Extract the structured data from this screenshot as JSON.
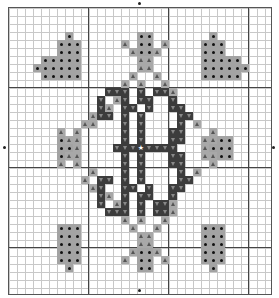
{
  "chart": {
    "cols": 33,
    "rows": 36,
    "cell_size": 8,
    "major_every": 10,
    "colors": {
      "dot": "#a3a3a3",
      "tri": "#a8a8a8",
      "dark": "#3c3c3c",
      "grid": "#c8c8c8",
      "major": "#444444"
    },
    "center_markers": [
      {
        "side": "top",
        "col": 16
      },
      {
        "side": "bottom",
        "col": 16
      },
      {
        "side": "left",
        "row": 17
      },
      {
        "side": "right",
        "row": 17
      }
    ],
    "motifs": [
      {
        "name": "heart-top-left",
        "symbol": "dot",
        "cells": [
          [
            3,
            7
          ],
          [
            4,
            6
          ],
          [
            4,
            7
          ],
          [
            4,
            8
          ],
          [
            5,
            6
          ],
          [
            5,
            7
          ],
          [
            5,
            8
          ],
          [
            6,
            4
          ],
          [
            6,
            5
          ],
          [
            6,
            6
          ],
          [
            6,
            7
          ],
          [
            6,
            8
          ],
          [
            7,
            3
          ],
          [
            7,
            4
          ],
          [
            7,
            5
          ],
          [
            7,
            6
          ],
          [
            7,
            7
          ],
          [
            7,
            8
          ],
          [
            8,
            4
          ],
          [
            8,
            5
          ],
          [
            8,
            6
          ],
          [
            8,
            7
          ],
          [
            8,
            8
          ]
        ]
      },
      {
        "name": "heart-top-right",
        "symbol": "dot",
        "cells": [
          [
            3,
            25
          ],
          [
            4,
            24
          ],
          [
            4,
            25
          ],
          [
            4,
            26
          ],
          [
            5,
            24
          ],
          [
            5,
            25
          ],
          [
            5,
            26
          ],
          [
            6,
            24
          ],
          [
            6,
            25
          ],
          [
            6,
            26
          ],
          [
            6,
            27
          ],
          [
            6,
            28
          ],
          [
            7,
            24
          ],
          [
            7,
            25
          ],
          [
            7,
            26
          ],
          [
            7,
            27
          ],
          [
            7,
            28
          ],
          [
            7,
            29
          ],
          [
            8,
            24
          ],
          [
            8,
            25
          ],
          [
            8,
            26
          ],
          [
            8,
            27
          ],
          [
            8,
            28
          ]
        ]
      },
      {
        "name": "heart-bottom-left",
        "symbol": "dot",
        "cells": [
          [
            27,
            6
          ],
          [
            27,
            7
          ],
          [
            27,
            8
          ],
          [
            28,
            6
          ],
          [
            28,
            7
          ],
          [
            28,
            8
          ],
          [
            29,
            6
          ],
          [
            29,
            7
          ],
          [
            29,
            8
          ],
          [
            30,
            6
          ],
          [
            30,
            7
          ],
          [
            30,
            8
          ],
          [
            31,
            6
          ],
          [
            31,
            7
          ],
          [
            31,
            8
          ],
          [
            32,
            7
          ]
        ]
      },
      {
        "name": "heart-bottom-right",
        "symbol": "dot",
        "cells": [
          [
            27,
            24
          ],
          [
            27,
            25
          ],
          [
            27,
            26
          ],
          [
            28,
            24
          ],
          [
            28,
            25
          ],
          [
            28,
            26
          ],
          [
            29,
            24
          ],
          [
            29,
            25
          ],
          [
            29,
            26
          ],
          [
            30,
            24
          ],
          [
            30,
            25
          ],
          [
            30,
            26
          ],
          [
            31,
            24
          ],
          [
            31,
            25
          ],
          [
            31,
            26
          ],
          [
            32,
            25
          ]
        ]
      },
      {
        "name": "figure-top-dots",
        "symbol": "dot",
        "cells": [
          [
            3,
            16
          ],
          [
            3,
            17
          ],
          [
            4,
            16
          ],
          [
            4,
            17
          ],
          [
            5,
            16
          ],
          [
            5,
            17
          ]
        ]
      },
      {
        "name": "figure-top-tri",
        "symbol": "tri",
        "cells": [
          [
            4,
            14
          ],
          [
            4,
            19
          ],
          [
            5,
            15
          ],
          [
            5,
            18
          ],
          [
            6,
            16
          ],
          [
            6,
            17
          ],
          [
            7,
            16
          ],
          [
            7,
            17
          ],
          [
            8,
            15
          ],
          [
            8,
            18
          ],
          [
            9,
            14
          ],
          [
            9,
            19
          ]
        ]
      },
      {
        "name": "figure-bottom-dots",
        "symbol": "dot",
        "cells": [
          [
            30,
            16
          ],
          [
            30,
            17
          ],
          [
            31,
            16
          ],
          [
            31,
            17
          ],
          [
            32,
            16
          ],
          [
            32,
            17
          ]
        ]
      },
      {
        "name": "figure-bottom-tri",
        "symbol": "tri",
        "cells": [
          [
            26,
            14
          ],
          [
            26,
            19
          ],
          [
            27,
            15
          ],
          [
            27,
            18
          ],
          [
            28,
            16
          ],
          [
            28,
            17
          ],
          [
            29,
            16
          ],
          [
            29,
            17
          ],
          [
            30,
            15
          ],
          [
            30,
            18
          ],
          [
            31,
            14
          ],
          [
            31,
            19
          ]
        ]
      },
      {
        "name": "figure-left-dots",
        "symbol": "dot",
        "cells": [
          [
            16,
            6
          ],
          [
            17,
            6
          ],
          [
            17,
            7
          ],
          [
            18,
            6
          ]
        ]
      },
      {
        "name": "figure-left-tri",
        "symbol": "tri",
        "cells": [
          [
            14,
            10
          ],
          [
            15,
            6
          ],
          [
            15,
            8
          ],
          [
            16,
            7
          ],
          [
            16,
            8
          ],
          [
            17,
            8
          ],
          [
            18,
            7
          ],
          [
            18,
            8
          ],
          [
            19,
            6
          ],
          [
            19,
            8
          ],
          [
            20,
            10
          ]
        ]
      },
      {
        "name": "figure-right-dots",
        "symbol": "dot",
        "cells": [
          [
            16,
            26
          ],
          [
            16,
            27
          ],
          [
            17,
            25
          ],
          [
            17,
            26
          ],
          [
            17,
            27
          ],
          [
            18,
            26
          ],
          [
            18,
            27
          ]
        ]
      },
      {
        "name": "figure-right-tri",
        "symbol": "tri",
        "cells": [
          [
            14,
            23
          ],
          [
            15,
            25
          ],
          [
            16,
            24
          ],
          [
            16,
            25
          ],
          [
            17,
            24
          ],
          [
            18,
            24
          ],
          [
            18,
            25
          ],
          [
            19,
            25
          ],
          [
            20,
            23
          ]
        ]
      },
      {
        "name": "diamond-outline-tri",
        "symbol": "tri",
        "cells": [
          [
            10,
            20
          ],
          [
            11,
            13
          ],
          [
            9,
            16
          ],
          [
            12,
            12
          ],
          [
            13,
            10
          ],
          [
            14,
            9
          ],
          [
            21,
            9
          ],
          [
            22,
            10
          ],
          [
            23,
            12
          ],
          [
            24,
            13
          ],
          [
            25,
            20
          ],
          [
            24,
            20
          ],
          [
            26,
            16
          ],
          [
            13,
            22
          ],
          [
            21,
            22
          ],
          [
            22,
            21
          ]
        ]
      },
      {
        "name": "monogram-dark",
        "symbol": "dark",
        "cells": [
          [
            10,
            12
          ],
          [
            10,
            13
          ],
          [
            10,
            14
          ],
          [
            10,
            16
          ],
          [
            10,
            18
          ],
          [
            10,
            19
          ],
          [
            11,
            11
          ],
          [
            11,
            14
          ],
          [
            11,
            16
          ],
          [
            11,
            17
          ],
          [
            11,
            20
          ],
          [
            12,
            11
          ],
          [
            12,
            14
          ],
          [
            12,
            15
          ],
          [
            12,
            17
          ],
          [
            12,
            20
          ],
          [
            12,
            21
          ],
          [
            13,
            11
          ],
          [
            13,
            12
          ],
          [
            13,
            14
          ],
          [
            13,
            16
          ],
          [
            13,
            21
          ],
          [
            13,
            22
          ],
          [
            14,
            14
          ],
          [
            14,
            16
          ],
          [
            14,
            21
          ],
          [
            15,
            14
          ],
          [
            15,
            16
          ],
          [
            15,
            20
          ],
          [
            15,
            21
          ],
          [
            16,
            14
          ],
          [
            16,
            16
          ],
          [
            16,
            20
          ],
          [
            16,
            21
          ],
          [
            17,
            13
          ],
          [
            17,
            14
          ],
          [
            17,
            15
          ],
          [
            17,
            17
          ],
          [
            17,
            18
          ],
          [
            17,
            19
          ],
          [
            17,
            20
          ],
          [
            18,
            14
          ],
          [
            18,
            16
          ],
          [
            18,
            20
          ],
          [
            18,
            21
          ],
          [
            19,
            14
          ],
          [
            19,
            16
          ],
          [
            19,
            20
          ],
          [
            19,
            21
          ],
          [
            20,
            14
          ],
          [
            20,
            16
          ],
          [
            20,
            21
          ],
          [
            21,
            11
          ],
          [
            21,
            12
          ],
          [
            21,
            14
          ],
          [
            21,
            16
          ],
          [
            21,
            21
          ],
          [
            21,
            22
          ],
          [
            22,
            11
          ],
          [
            22,
            14
          ],
          [
            22,
            15
          ],
          [
            22,
            17
          ],
          [
            22,
            20
          ],
          [
            22,
            21
          ],
          [
            23,
            11
          ],
          [
            23,
            14
          ],
          [
            23,
            16
          ],
          [
            23,
            17
          ],
          [
            23,
            20
          ],
          [
            24,
            11
          ],
          [
            24,
            14
          ],
          [
            24,
            16
          ],
          [
            24,
            18
          ],
          [
            24,
            19
          ],
          [
            25,
            12
          ],
          [
            25,
            13
          ],
          [
            25,
            14
          ],
          [
            25,
            16
          ],
          [
            25,
            18
          ],
          [
            25,
            19
          ]
        ]
      },
      {
        "name": "center-star",
        "symbol": "star",
        "cells": [
          [
            17,
            16
          ]
        ]
      }
    ]
  }
}
